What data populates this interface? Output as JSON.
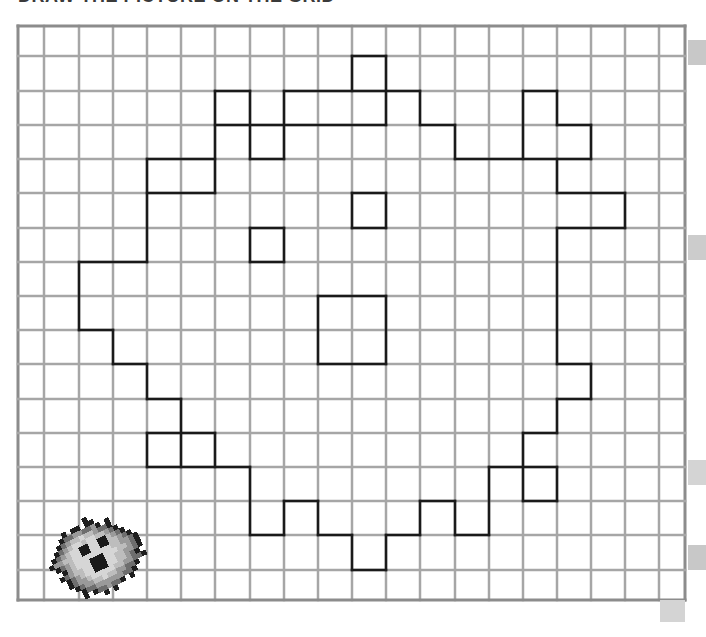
{
  "heading": {
    "text": "DRAW THE PICTURE ON THE GRID",
    "clipped": true
  },
  "grid": {
    "x_lines": [
      18,
      44,
      79,
      113,
      147,
      181,
      215,
      250,
      284,
      318,
      352,
      386,
      420,
      455,
      489,
      523,
      557,
      591,
      625,
      659,
      685
    ],
    "y_lines": [
      26,
      56,
      91,
      125,
      159,
      193,
      228,
      262,
      296,
      330,
      364,
      399,
      433,
      467,
      501,
      535,
      570,
      600
    ],
    "line_color": "#a6a6a6",
    "border_color": "#8c8c8c",
    "outline_color": "#1a1a1a"
  },
  "outline": {
    "horizontal": [
      [
        1,
        10,
        11
      ],
      [
        2,
        6,
        7
      ],
      [
        2,
        8,
        12
      ],
      [
        2,
        15,
        16
      ],
      [
        3,
        6,
        11
      ],
      [
        3,
        12,
        13
      ],
      [
        3,
        16,
        17
      ],
      [
        4,
        4,
        6
      ],
      [
        4,
        7,
        8
      ],
      [
        4,
        13,
        17
      ],
      [
        5,
        4,
        6
      ],
      [
        5,
        10,
        11
      ],
      [
        5,
        16,
        18
      ],
      [
        6,
        7,
        8
      ],
      [
        6,
        10,
        11
      ],
      [
        6,
        16,
        18
      ],
      [
        7,
        2,
        4
      ],
      [
        7,
        7,
        8
      ],
      [
        8,
        9,
        11
      ],
      [
        9,
        2,
        3
      ],
      [
        10,
        3,
        4
      ],
      [
        10,
        9,
        11
      ],
      [
        10,
        16,
        17
      ],
      [
        11,
        4,
        5
      ],
      [
        11,
        16,
        17
      ],
      [
        12,
        4,
        6
      ],
      [
        12,
        15,
        16
      ],
      [
        13,
        4,
        7
      ],
      [
        13,
        14,
        16
      ],
      [
        14,
        8,
        9
      ],
      [
        14,
        12,
        13
      ],
      [
        14,
        15,
        16
      ],
      [
        15,
        7,
        8
      ],
      [
        15,
        9,
        10
      ],
      [
        15,
        11,
        12
      ],
      [
        15,
        13,
        14
      ],
      [
        16,
        10,
        11
      ]
    ],
    "vertical": [
      [
        2,
        7,
        9
      ],
      [
        3,
        9,
        10
      ],
      [
        4,
        4,
        7
      ],
      [
        4,
        10,
        11
      ],
      [
        4,
        12,
        13
      ],
      [
        5,
        11,
        13
      ],
      [
        6,
        2,
        5
      ],
      [
        6,
        12,
        13
      ],
      [
        7,
        2,
        4
      ],
      [
        7,
        6,
        7
      ],
      [
        7,
        13,
        15
      ],
      [
        8,
        2,
        4
      ],
      [
        8,
        6,
        7
      ],
      [
        8,
        14,
        15
      ],
      [
        9,
        8,
        10
      ],
      [
        9,
        14,
        15
      ],
      [
        10,
        1,
        2
      ],
      [
        10,
        5,
        6
      ],
      [
        10,
        15,
        16
      ],
      [
        11,
        1,
        3
      ],
      [
        11,
        5,
        6
      ],
      [
        11,
        8,
        10
      ],
      [
        11,
        15,
        16
      ],
      [
        12,
        2,
        3
      ],
      [
        12,
        14,
        15
      ],
      [
        13,
        3,
        4
      ],
      [
        13,
        14,
        15
      ],
      [
        14,
        13,
        15
      ],
      [
        15,
        2,
        4
      ],
      [
        15,
        12,
        14
      ],
      [
        16,
        2,
        3
      ],
      [
        16,
        4,
        5
      ],
      [
        16,
        6,
        10
      ],
      [
        16,
        11,
        12
      ],
      [
        16,
        13,
        14
      ],
      [
        17,
        3,
        4
      ],
      [
        17,
        10,
        11
      ],
      [
        18,
        5,
        6
      ]
    ]
  },
  "markers": [
    {
      "x": 688,
      "y": 40,
      "w": 18,
      "h": 25,
      "color": "#c8c8c8"
    },
    {
      "x": 688,
      "y": 235,
      "w": 18,
      "h": 25,
      "color": "#cccccc"
    },
    {
      "x": 688,
      "y": 460,
      "w": 18,
      "h": 25,
      "color": "#d4d4d4"
    },
    {
      "x": 688,
      "y": 545,
      "w": 18,
      "h": 25,
      "color": "#c8c8c8"
    },
    {
      "x": 660,
      "y": 600,
      "w": 25,
      "h": 22,
      "color": "#d4d4d4"
    }
  ],
  "sprite": {
    "name": "fuzzy-monster",
    "colors": {
      "outline": "#1e1e1e",
      "dark": "#6e6e6e",
      "mid": "#9a9a9a",
      "light": "#bdbdbd",
      "pale": "#d6d6d6",
      "eye": "#1a1a1a"
    }
  }
}
